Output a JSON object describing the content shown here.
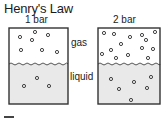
{
  "title": "Henry's Law",
  "beakers": [
    {
      "pressure_label": "1 bar"
    },
    {
      "pressure_label": "2 bar"
    }
  ],
  "labels": {
    "gas": "gas",
    "liquid": "liquid"
  }
}
